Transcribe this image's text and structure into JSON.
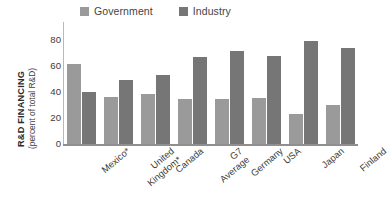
{
  "chart_data": {
    "type": "bar",
    "title": "",
    "subtitle": "",
    "xlabel": "",
    "ylabel_main": "R&D FINANCING",
    "ylabel_sub": "(percent of total R&D)",
    "ylim": [
      0,
      88
    ],
    "yticks": [
      0,
      20,
      40,
      60,
      80
    ],
    "ytick_labels": [
      "0",
      "20",
      "40",
      "60",
      "80"
    ],
    "grid": false,
    "legend_position": "top",
    "categories": [
      "Mexico*",
      "United Kingdom*",
      "Canada",
      "G7 Average",
      "Germany",
      "USA",
      "Japan",
      "Finland"
    ],
    "series": [
      {
        "name": "Government",
        "color": "#9a9a9a",
        "values": [
          61.5,
          36.5,
          38.5,
          35.0,
          34.5,
          35.5,
          23.0,
          30.5
        ]
      },
      {
        "name": "Industry",
        "color": "#767676",
        "values": [
          40.5,
          49.5,
          53.0,
          67.0,
          72.0,
          68.0,
          79.5,
          74.0
        ]
      }
    ],
    "annotations": []
  },
  "legend": {
    "items": [
      {
        "label": "Government",
        "color": "#9a9a9a"
      },
      {
        "label": "Industry",
        "color": "#767676"
      }
    ]
  },
  "axis": {
    "y_title_main": "R&D FINANCING",
    "y_title_sub": "(percent of total R&D)"
  },
  "colors": {
    "government": "#9a9a9a",
    "industry": "#767676",
    "axis": "#8f8f8f",
    "text": "#3b3b3b",
    "background": "#ffffff"
  }
}
